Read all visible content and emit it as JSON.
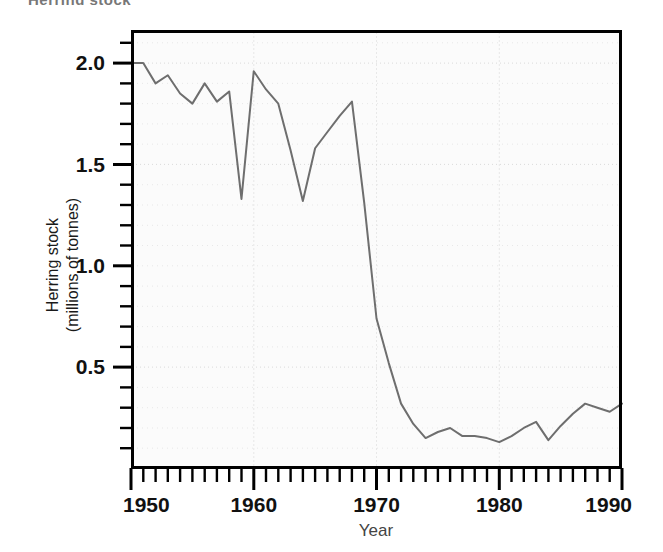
{
  "top_fragment": "Herring stock",
  "chart_data": {
    "type": "line",
    "title": "",
    "xlabel": "Year",
    "ylabel": "Herring stock (millions of tonnes)",
    "ylabel_line1": "Herring stock",
    "ylabel_line2": "(millions of tonnes)",
    "xlim": [
      1950,
      1990
    ],
    "ylim": [
      0.0,
      2.17
    ],
    "xticks": [
      1950,
      1960,
      1970,
      1980,
      1990
    ],
    "xtick_labels": [
      "1950",
      "1960",
      "1970",
      "1980",
      "1990"
    ],
    "xminor_step": 1,
    "yticks": [
      0.5,
      1.0,
      1.5,
      2.0
    ],
    "ytick_labels": [
      "0.5",
      "1.0",
      "1.5",
      "2.0"
    ],
    "yminor_step": 0.1,
    "grid": true,
    "grid_style": "dotted",
    "legend": "none",
    "line_color": "#6e6e6e",
    "line_width": 2,
    "frame_color": "#000000",
    "plot_background": "#fbfbfb",
    "series": [
      {
        "name": "Herring stock",
        "x": [
          1950,
          1951,
          1952,
          1953,
          1954,
          1955,
          1956,
          1957,
          1958,
          1959,
          1960,
          1961,
          1962,
          1963,
          1964,
          1965,
          1966,
          1967,
          1968,
          1969,
          1970,
          1971,
          1972,
          1973,
          1974,
          1975,
          1976,
          1977,
          1978,
          1979,
          1980,
          1981,
          1982,
          1983,
          1984,
          1985,
          1986,
          1987,
          1988,
          1989,
          1990
        ],
        "values": [
          2.0,
          2.0,
          1.9,
          1.94,
          1.85,
          1.8,
          1.9,
          1.81,
          1.86,
          1.33,
          1.96,
          1.87,
          1.8,
          1.57,
          1.32,
          1.58,
          1.66,
          1.74,
          1.81,
          1.31,
          0.74,
          0.52,
          0.32,
          0.22,
          0.15,
          0.18,
          0.2,
          0.16,
          0.16,
          0.15,
          0.13,
          0.16,
          0.2,
          0.23,
          0.14,
          0.21,
          0.27,
          0.32,
          0.3,
          0.28,
          0.32
        ]
      }
    ]
  }
}
